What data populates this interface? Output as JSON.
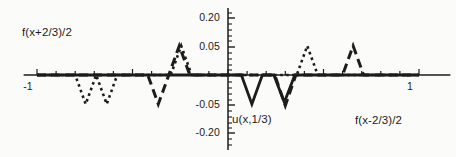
{
  "figure": {
    "background_color": "#fbfbfa",
    "ink_color": "#1c1c1c",
    "width": 456,
    "height": 157
  },
  "axes": {
    "x_label": "x",
    "y_label": "",
    "x_ticks": [
      {
        "value": -1,
        "label": "-1",
        "px": 28
      },
      {
        "value": 0,
        "label": "",
        "px": 228
      },
      {
        "value": 1,
        "label": "1",
        "px": 410
      }
    ],
    "y_ticks": [
      {
        "value": 0.2,
        "label": "0.20",
        "px": 18
      },
      {
        "value": 0.05,
        "label": "0.05",
        "px": 47
      },
      {
        "value": -0.05,
        "label": "-0.05",
        "px": 105
      },
      {
        "value": -0.2,
        "label": "-0.20",
        "px": 133
      }
    ]
  },
  "annotations": [
    {
      "name": "label-f-plus",
      "text": "f(x+2/3)/2",
      "x": 22,
      "y": 26
    },
    {
      "name": "label-u",
      "text": "u(x,1/3)",
      "x": 232,
      "y": 113
    },
    {
      "name": "label-f-minus",
      "text": "f(x-2/3)/2",
      "x": 355,
      "y": 114
    }
  ],
  "chart_data": {
    "type": "line",
    "title": "",
    "xlabel": "x",
    "ylabel": "",
    "xlim": [
      -1.07,
      1.07
    ],
    "ylim": [
      -0.22,
      0.22
    ],
    "grid": false,
    "legend": "none",
    "axis_scale_note": "y tick spacing is nonlinear: 0.05 and 0.20 ticks are compressed",
    "annotations": [
      "f(x+2/3)/2",
      "u(x,1/3)",
      "f(x-2/3)/2"
    ],
    "series": [
      {
        "name": "f(x+2/3)/2",
        "style": "dotted",
        "color": "#1c1c1c",
        "linewidth": 2.6,
        "points": [
          [
            -1.0,
            0.0
          ],
          [
            -0.8,
            0.0
          ],
          [
            -0.745,
            -0.062
          ],
          [
            -0.69,
            0.0
          ],
          [
            -0.635,
            -0.062
          ],
          [
            -0.58,
            0.0
          ],
          [
            -0.3,
            0.0
          ],
          [
            -0.245,
            0.062
          ],
          [
            -0.19,
            0.0
          ],
          [
            0.0,
            0.0
          ],
          [
            0.36,
            0.0
          ],
          [
            0.415,
            0.062
          ],
          [
            0.47,
            0.0
          ],
          [
            0.63,
            0.0
          ],
          [
            1.0,
            0.0
          ]
        ]
      },
      {
        "name": "f(x-2/3)/2",
        "style": "dashed",
        "color": "#1c1c1c",
        "linewidth": 3.0,
        "points": [
          [
            -1.0,
            0.0
          ],
          [
            -0.42,
            0.0
          ],
          [
            -0.365,
            -0.062
          ],
          [
            -0.31,
            0.0
          ],
          [
            -0.255,
            0.062
          ],
          [
            -0.2,
            0.0
          ],
          [
            0.0,
            0.0
          ],
          [
            0.245,
            0.0
          ],
          [
            0.3,
            -0.065
          ],
          [
            0.355,
            0.0
          ],
          [
            0.6,
            0.0
          ],
          [
            0.655,
            0.062
          ],
          [
            0.71,
            0.0
          ],
          [
            1.0,
            0.0
          ]
        ]
      },
      {
        "name": "u(x,1/3)",
        "style": "solid",
        "color": "#1c1c1c",
        "linewidth": 2.8,
        "points": [
          [
            -1.0,
            0.0
          ],
          [
            0.07,
            0.0
          ],
          [
            0.125,
            -0.062
          ],
          [
            0.18,
            0.0
          ],
          [
            0.24,
            0.0
          ],
          [
            0.295,
            -0.058
          ],
          [
            0.35,
            0.0
          ],
          [
            1.0,
            0.0
          ]
        ]
      }
    ]
  }
}
